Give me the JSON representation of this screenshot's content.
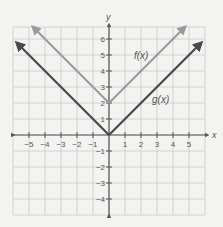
{
  "chart_data": {
    "type": "line",
    "title": "",
    "xlabel": "x",
    "ylabel": "y",
    "xlim": [
      -6,
      6
    ],
    "ylim": [
      -5,
      7
    ],
    "grid": true,
    "x_ticks": [
      -5,
      -4,
      -3,
      -2,
      -1,
      1,
      2,
      3,
      4,
      5
    ],
    "y_ticks": [
      -4,
      -3,
      -2,
      -1,
      1,
      2,
      3,
      4,
      5,
      6
    ],
    "x_tick_labels": [
      "−5",
      "−4",
      "−3",
      "−2",
      "−1",
      "1",
      "2",
      "3",
      "4",
      "5"
    ],
    "y_tick_labels": [
      "−4",
      "−3",
      "−2",
      "−1",
      "1",
      "2",
      "3",
      "4",
      "5",
      "6"
    ],
    "series": [
      {
        "name": "f(x)",
        "expression": "|x| + 2",
        "color": "#9a9a9a",
        "points": [
          [
            -4.7,
            6.7
          ],
          [
            0,
            2
          ],
          [
            4.7,
            6.7
          ]
        ],
        "label_position": [
          1.7,
          5.3
        ]
      },
      {
        "name": "g(x)",
        "expression": "|x|",
        "color": "#4a4a4a",
        "points": [
          [
            -5.7,
            5.7
          ],
          [
            0,
            0
          ],
          [
            5.7,
            5.7
          ]
        ],
        "label_position": [
          3.0,
          3.0
        ]
      }
    ],
    "legend": "inline labels"
  },
  "labels": {
    "x_axis": "x",
    "y_axis": "y",
    "f": "f(x)",
    "g": "g(x)"
  },
  "colors": {
    "background": "#f3f3f1",
    "grid": "#c9c9c9",
    "axis": "#555555",
    "f_line": "#9a9a9a",
    "g_line": "#4a4a4a",
    "text": "#555555"
  }
}
